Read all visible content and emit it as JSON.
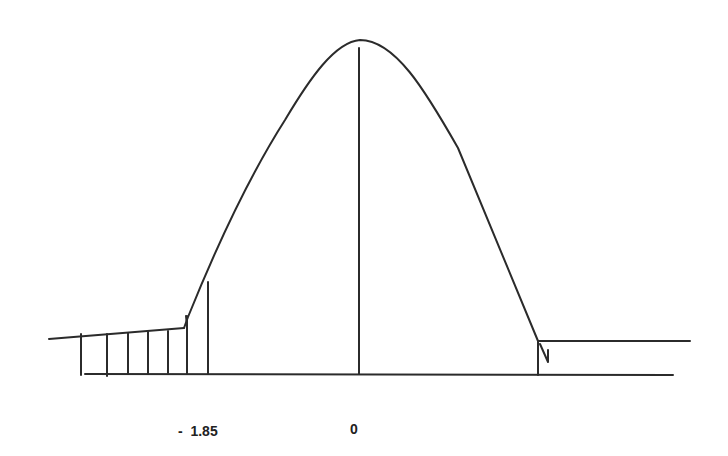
{
  "diagram": {
    "type": "normal-distribution-sketch",
    "labels": {
      "critical_value": "-  1.85",
      "mean": "0"
    },
    "colors": {
      "stroke": "#2b2b2b",
      "background": "#ffffff",
      "text": "#222222"
    },
    "shaded_region": "left tail (z < -1.85)",
    "hatch_line_count": 6
  }
}
